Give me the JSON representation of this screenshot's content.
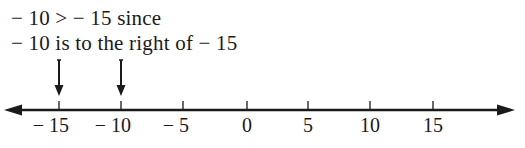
{
  "caption": {
    "line1": "− 10 >  − 15 since",
    "line2": "− 10 is to the right of  − 15"
  },
  "number_line": {
    "min_visible": -15,
    "max_visible": 15,
    "step": 5,
    "ticks": [
      {
        "value": -15,
        "label": "− 15",
        "x": 59
      },
      {
        "value": -10,
        "label": "− 10",
        "x": 121
      },
      {
        "value": -5,
        "label": "− 5",
        "x": 183
      },
      {
        "value": 0,
        "label": "0",
        "x": 247
      },
      {
        "value": 5,
        "label": "5",
        "x": 308
      },
      {
        "value": 10,
        "label": "10",
        "x": 370
      },
      {
        "value": 15,
        "label": "15",
        "x": 433
      }
    ],
    "pointers": [
      {
        "value": -15,
        "x": 59
      },
      {
        "value": -10,
        "x": 121
      }
    ],
    "arrows_both_ends": true,
    "color": "#1a1a1a"
  }
}
